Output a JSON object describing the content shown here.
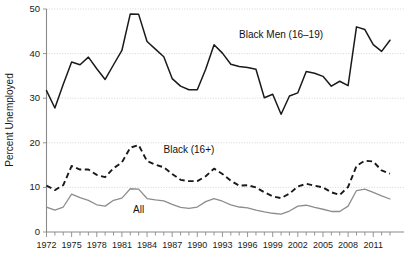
{
  "chart_data": {
    "type": "line",
    "title": "",
    "xlabel": "",
    "ylabel": "Percent Unemployed",
    "ylim": [
      0,
      50
    ],
    "yticks": [
      0,
      10,
      20,
      30,
      40,
      50
    ],
    "xlim": [
      1972,
      2013
    ],
    "xticks": [
      1972,
      1975,
      1978,
      1981,
      1984,
      1987,
      1990,
      1993,
      1996,
      1999,
      2002,
      2005,
      2008,
      2011
    ],
    "xtick_labels": [
      "1972",
      "1975",
      "1978",
      "1981",
      "1984",
      "1987",
      "1990",
      "1993",
      "1996",
      "1999",
      "2002",
      "2005",
      "2008",
      "2011"
    ],
    "ytick_labels": [
      "0",
      "10",
      "20",
      "30",
      "40",
      "50"
    ],
    "grid": true,
    "legend_position": "inline-annotations",
    "x": [
      1972,
      1973,
      1974,
      1975,
      1976,
      1977,
      1978,
      1979,
      1980,
      1981,
      1982,
      1983,
      1984,
      1985,
      1986,
      1987,
      1988,
      1989,
      1990,
      1991,
      1992,
      1993,
      1994,
      1995,
      1996,
      1997,
      1998,
      1999,
      2000,
      2001,
      2002,
      2003,
      2004,
      2005,
      2006,
      2007,
      2008,
      2009,
      2010,
      2011,
      2012,
      2013
    ],
    "series": [
      {
        "name": "Black Men (16–19)",
        "style": "solid",
        "color": "#1a1a1a",
        "label_x": 2000,
        "label_y": 43.5,
        "values": [
          31.7,
          27.8,
          33.1,
          38.1,
          37.5,
          39.2,
          36.6,
          34.2,
          37.5,
          40.7,
          48.9,
          48.8,
          42.7,
          41.0,
          39.3,
          34.4,
          32.7,
          31.9,
          31.9,
          36.5,
          42.0,
          40.1,
          37.6,
          37.1,
          36.9,
          36.5,
          30.1,
          30.9,
          26.4,
          30.5,
          31.2,
          36.0,
          35.6,
          34.9,
          32.7,
          33.8,
          32.8,
          46.0,
          45.4,
          42.0,
          40.5,
          43.0
        ]
      },
      {
        "name": "Black (16+)",
        "style": "dashed",
        "color": "#1a1a1a",
        "label_x": 1989,
        "label_y": 17.8,
        "values": [
          10.4,
          9.4,
          10.5,
          14.8,
          14.0,
          14.0,
          12.8,
          12.3,
          14.3,
          15.6,
          18.9,
          19.5,
          15.9,
          15.1,
          14.5,
          13.0,
          11.7,
          11.4,
          11.4,
          12.5,
          14.2,
          13.0,
          11.5,
          10.4,
          10.5,
          10.0,
          8.9,
          8.0,
          7.6,
          8.6,
          10.2,
          10.8,
          10.4,
          10.0,
          8.9,
          8.3,
          10.1,
          14.8,
          16.0,
          15.8,
          13.8,
          13.1
        ]
      },
      {
        "name": "All",
        "style": "solid",
        "color": "#8d8d8d",
        "label_x": 1983,
        "label_y": 4.2,
        "values": [
          5.6,
          4.9,
          5.6,
          8.5,
          7.7,
          7.1,
          6.1,
          5.8,
          7.1,
          7.6,
          9.7,
          9.6,
          7.5,
          7.2,
          7.0,
          6.2,
          5.5,
          5.3,
          5.6,
          6.8,
          7.5,
          6.9,
          6.1,
          5.6,
          5.4,
          4.9,
          4.5,
          4.2,
          4.0,
          4.7,
          5.8,
          6.0,
          5.5,
          5.1,
          4.6,
          4.6,
          5.8,
          9.3,
          9.6,
          8.9,
          8.1,
          7.4
        ]
      }
    ]
  }
}
